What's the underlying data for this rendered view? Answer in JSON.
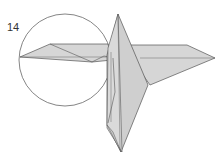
{
  "diagram": {
    "step_number": "14",
    "colors": {
      "paper_fill": "#d6d6d6",
      "paper_fill_dark": "#c4c4c4",
      "stroke": "#555555",
      "circle_stroke": "#666666",
      "background": "#ffffff"
    },
    "elements": [
      "detail-magnification-circle",
      "left-wing-flap",
      "right-wing-flap",
      "central-vertical-body",
      "lower-point"
    ]
  }
}
